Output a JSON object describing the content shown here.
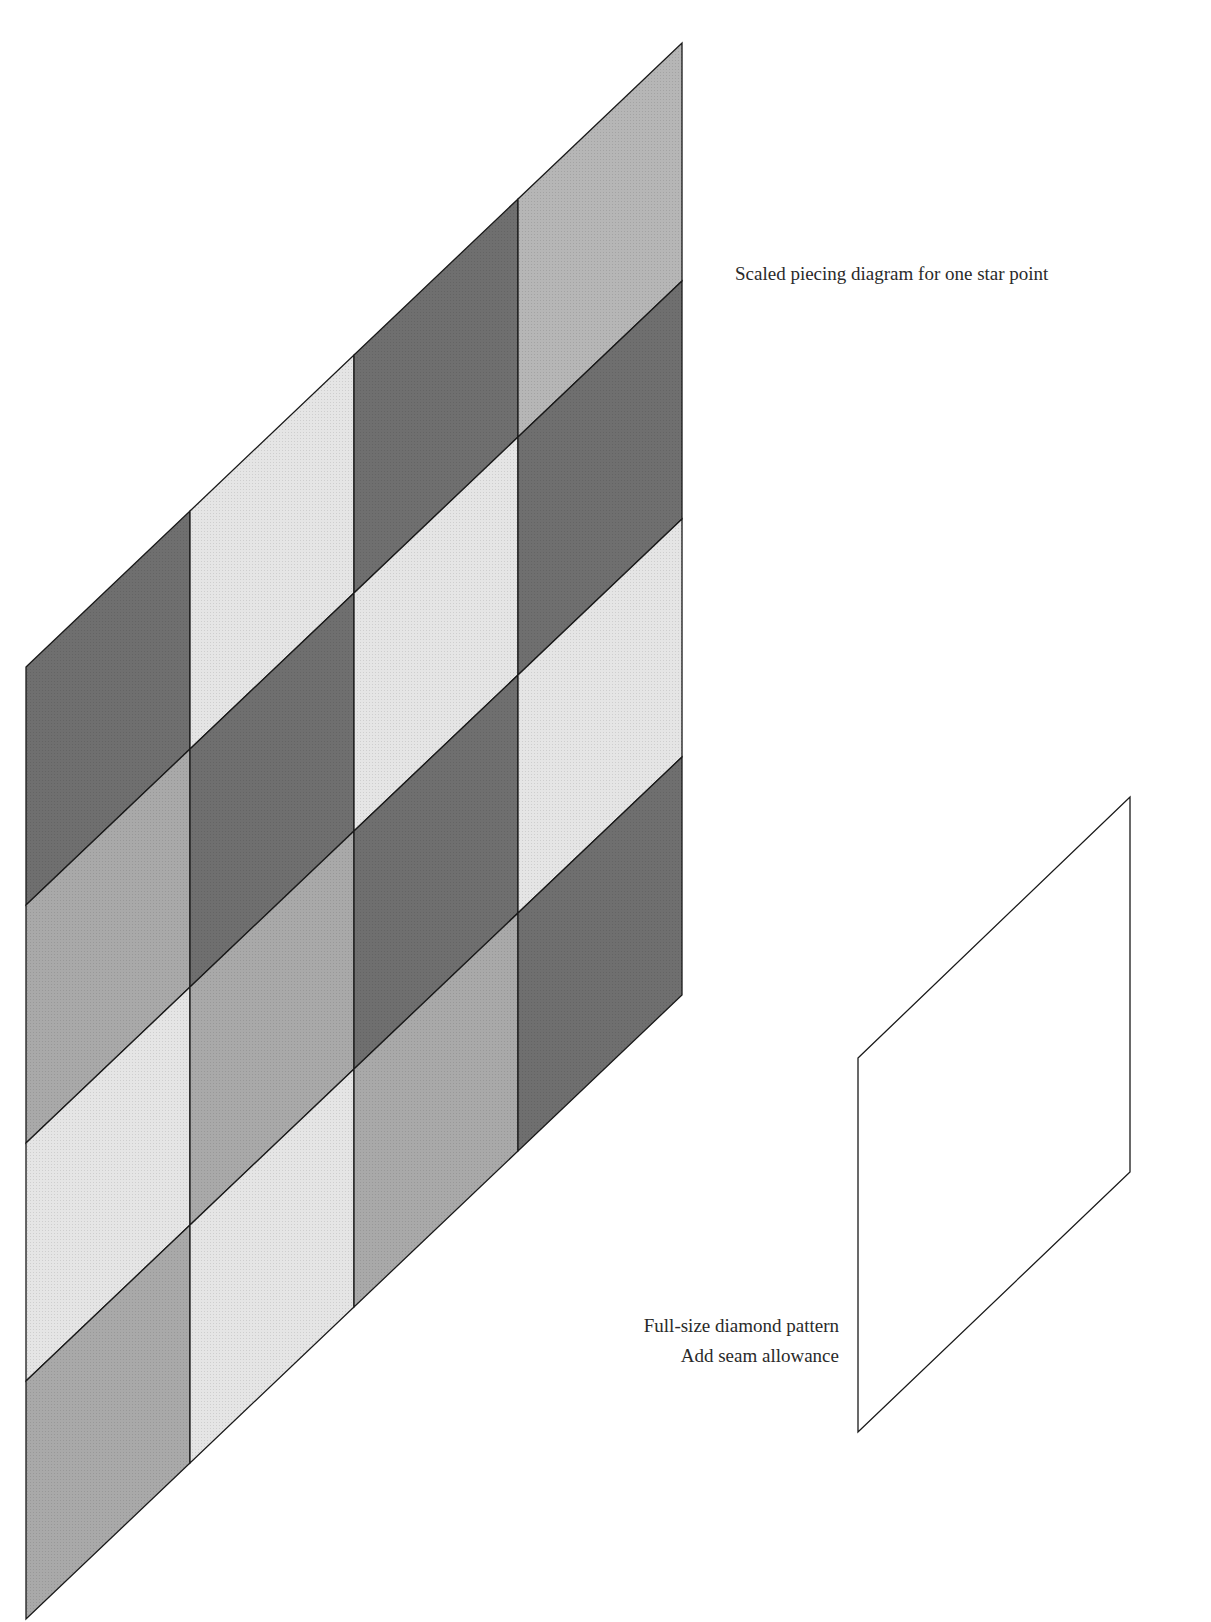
{
  "captions": {
    "piecing_diagram": "Scaled piecing diagram for one star point",
    "pattern_title": "Full-size diamond pattern",
    "pattern_note": "Add seam allowance"
  },
  "colors": {
    "dark": "#6f6f6f",
    "medium": "#a9a9a9",
    "medium_light": "#b6b6b6",
    "light": "#e5e5e5",
    "outline": "#1a1a1a"
  },
  "piecing_grid": {
    "columns": 4,
    "rows": 4,
    "origin": [
      26,
      667
    ],
    "column_width": 164,
    "row_height": 238,
    "column_rise": 156,
    "cells": [
      [
        "dark",
        "medium",
        "light",
        "medium"
      ],
      [
        "light",
        "dark",
        "medium",
        "light"
      ],
      [
        "dark",
        "light",
        "dark",
        "medium"
      ],
      [
        "medium_light",
        "dark",
        "light",
        "dark"
      ]
    ]
  },
  "pattern_diamond": {
    "points": [
      [
        858,
        1058
      ],
      [
        1130,
        797
      ],
      [
        1130,
        1172
      ],
      [
        858,
        1432
      ]
    ]
  }
}
